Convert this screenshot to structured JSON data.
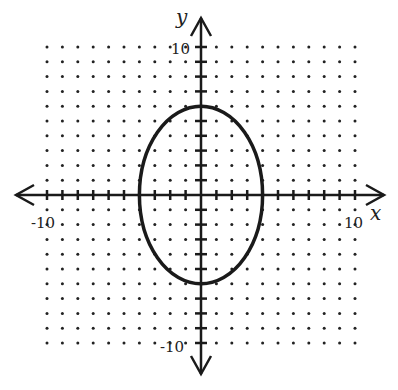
{
  "chart_data": {
    "type": "line",
    "title": "",
    "xlabel": "x",
    "ylabel": "y",
    "xlim": [
      -10,
      10
    ],
    "ylim": [
      -10,
      10
    ],
    "grid": "dots",
    "tick_step": 1,
    "tick_labels": {
      "x": [
        "-10",
        "10"
      ],
      "y": [
        "10",
        "-10"
      ]
    },
    "series": [
      {
        "name": "ellipse",
        "shape": "ellipse",
        "center": [
          0,
          0
        ],
        "semi_axis_x": 4,
        "semi_axis_y": 6,
        "equation": "x^2/16 + y^2/36 = 1"
      }
    ]
  },
  "labels": {
    "x_axis": "x",
    "y_axis": "y",
    "x_min": "-10",
    "x_max": "10",
    "y_max": "10",
    "y_min": "-10"
  }
}
